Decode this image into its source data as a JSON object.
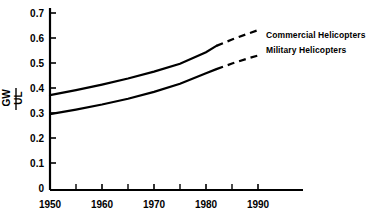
{
  "chart_data": {
    "type": "line",
    "title": "",
    "subtitle": "",
    "xlabel": "",
    "ylabel": "UL/GW",
    "ylabel_numerator": "UL",
    "ylabel_denominator": "GW",
    "xlim": [
      1950,
      1995
    ],
    "ylim": [
      0,
      0.7
    ],
    "grid": false,
    "legend_position": "right",
    "x_ticks_major": [
      1950,
      1960,
      1970,
      1980,
      1990
    ],
    "x_tick_labels": [
      "1950",
      "1960",
      "1970",
      "1980",
      "1990"
    ],
    "x_ticks_minor": [
      1955,
      1965,
      1975,
      1985
    ],
    "y_ticks": [
      0,
      0.1,
      0.2,
      0.3,
      0.4,
      0.5,
      0.6,
      0.7
    ],
    "y_tick_labels": [
      "0",
      "0.1",
      "0.2",
      "0.3",
      "0.4",
      "0.5",
      "0.6",
      "0.7"
    ],
    "series": [
      {
        "name": "Commercial Helicopters",
        "style_solid": "solid",
        "style_projection": "dashed",
        "solid_range": [
          1950,
          1982
        ],
        "projection_range": [
          1982,
          1990
        ],
        "x": [
          1950,
          1955,
          1960,
          1965,
          1970,
          1975,
          1980,
          1982,
          1985,
          1988,
          1990
        ],
        "values": [
          0.375,
          0.395,
          0.417,
          0.441,
          0.468,
          0.499,
          0.545,
          0.57,
          0.595,
          0.618,
          0.632
        ]
      },
      {
        "name": "Military Helicopters",
        "style_solid": "solid",
        "style_projection": "dashed",
        "solid_range": [
          1950,
          1982
        ],
        "projection_range": [
          1982,
          1990
        ],
        "x": [
          1950,
          1955,
          1960,
          1965,
          1970,
          1975,
          1980,
          1982,
          1985,
          1988,
          1990
        ],
        "values": [
          0.3,
          0.318,
          0.338,
          0.361,
          0.388,
          0.42,
          0.462,
          0.478,
          0.5,
          0.52,
          0.532
        ]
      }
    ],
    "annotations": [
      {
        "text": "Commercial Helicopters",
        "target_series": "Commercial Helicopters"
      },
      {
        "text": "Military Helicopters",
        "target_series": "Military Helicopters"
      }
    ],
    "colors": {
      "line": "#000000",
      "axis": "#000000",
      "text": "#000000",
      "background": "#ffffff"
    }
  },
  "legend": {
    "items": [
      {
        "label": "Commercial Helicopters"
      },
      {
        "label": "Military Helicopters"
      }
    ]
  },
  "axes": {
    "y": {
      "labels": [
        "0.7",
        "0.6",
        "0.5",
        "0.4",
        "0.3",
        "0.2",
        "0.1",
        "0"
      ],
      "title_numerator": "UL",
      "title_denominator": "GW"
    },
    "x": {
      "labels": [
        "1950",
        "1960",
        "1970",
        "1980",
        "1990"
      ]
    }
  }
}
